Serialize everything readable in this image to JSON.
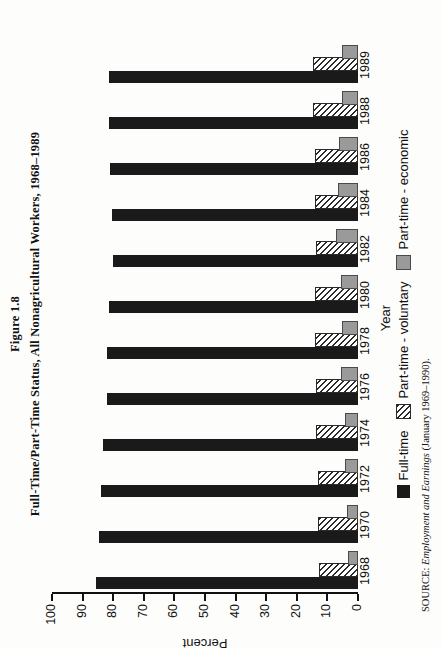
{
  "figure": {
    "label": "Figure 1.8",
    "title": "Full-Time/Part-Time Status, All Nonagricultural Workers, 1968–1989"
  },
  "source": {
    "prefix": "SOURCE:",
    "italic": "Employment and Earnings",
    "suffix": "(January 1969–1990)."
  },
  "legend": {
    "position": "bottom",
    "items": [
      {
        "key": "full_time",
        "label": "Full-time",
        "swatch": "solid-black",
        "color": "#1a1a1a"
      },
      {
        "key": "part_time_voluntary",
        "label": "Part-time - voluntary",
        "swatch": "hatched",
        "color": "#ffffff"
      },
      {
        "key": "part_time_economic",
        "label": "Part-time - economic",
        "swatch": "solid-gray",
        "color": "#9a9a9a"
      }
    ]
  },
  "chart_data": {
    "type": "bar",
    "orientation": "vertical",
    "title": "Full-Time/Part-Time Status, All Nonagricultural Workers, 1968–1989",
    "xlabel": "Year",
    "ylabel": "Percent",
    "ylim": [
      0,
      100
    ],
    "yticks": [
      0,
      10,
      20,
      30,
      40,
      50,
      60,
      70,
      80,
      90,
      100
    ],
    "grid": false,
    "categories": [
      "1968",
      "1970",
      "1972",
      "1974",
      "1976",
      "1978",
      "1980",
      "1982",
      "1984",
      "1986",
      "1988",
      "1989"
    ],
    "series": [
      {
        "name": "Full-time",
        "values": [
          85.5,
          84.5,
          84.0,
          83.5,
          82.0,
          82.0,
          81.5,
          80.0,
          80.5,
          81.0,
          81.5,
          81.5
        ]
      },
      {
        "name": "Part-time - voluntary",
        "values": [
          12.0,
          12.5,
          12.5,
          13.0,
          13.0,
          13.5,
          13.5,
          13.0,
          13.5,
          13.5,
          14.0,
          14.0
        ]
      },
      {
        "name": "Part-time - economic",
        "values": [
          2.5,
          3.0,
          3.5,
          3.5,
          5.0,
          4.5,
          5.0,
          6.5,
          6.0,
          5.5,
          4.5,
          4.5
        ]
      }
    ]
  }
}
